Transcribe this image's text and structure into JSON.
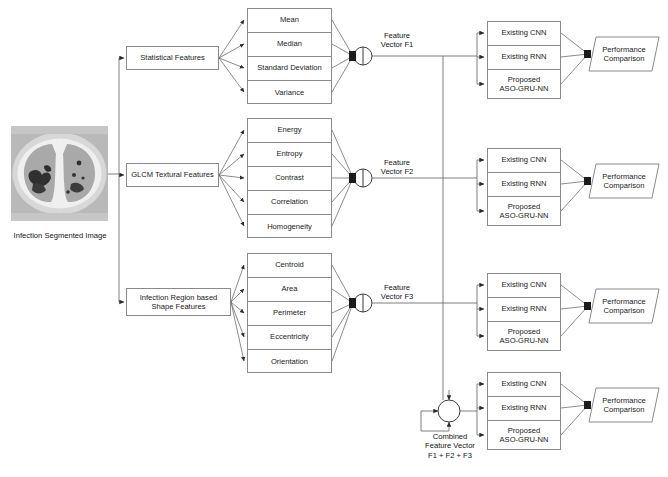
{
  "diagram": {
    "source_image": {
      "caption": "Infection Segmented Image",
      "alt": "CT scan slice of lungs with segmented infection regions"
    },
    "categories": [
      {
        "id": "statistical",
        "label": "Statistical Features",
        "features": [
          "Mean",
          "Median",
          "Standard Deviation",
          "Variance"
        ],
        "vector_label": "Feature\nVector F1"
      },
      {
        "id": "glcm",
        "label": "GLCM Textural Features",
        "features": [
          "Energy",
          "Entropy",
          "Contrast",
          "Correlation",
          "Homogeneity"
        ],
        "vector_label": "Feature\nVector F2"
      },
      {
        "id": "shape",
        "label": "Infection Region based\nShape Features",
        "features": [
          "Centroid",
          "Area",
          "Perimeter",
          "Eccentricity",
          "Orientation"
        ],
        "vector_label": "Feature\nVector F3"
      }
    ],
    "classifier_group": {
      "models": [
        "Existing CNN",
        "Existing RNN",
        "Proposed\nASO-GRU-NN"
      ],
      "output_label": "Performance\nComparison"
    },
    "combined": {
      "label": "Combined\nFeature Vector\nF1 + F2 + F3"
    },
    "colors": {
      "stroke": "#8a8a8a",
      "wire": "#6f6f6f",
      "arrow": "#2b2b2b",
      "text": "#141414",
      "background": "#ffffff"
    }
  }
}
